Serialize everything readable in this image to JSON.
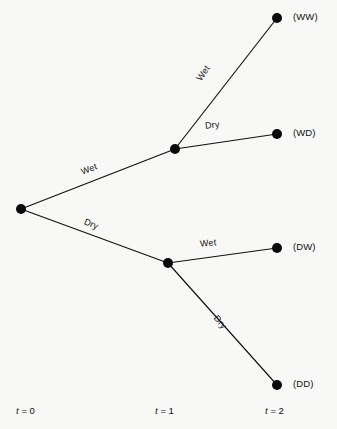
{
  "diagram": {
    "colors": {
      "background": "#f8f8f7",
      "line": "#111111",
      "node": "#0a0a0a",
      "text": "#111111"
    },
    "nodes": [
      {
        "id": "root",
        "label": "",
        "x": 21,
        "y": 209,
        "r": 5.0
      },
      {
        "id": "w",
        "label": "",
        "x": 175,
        "y": 149,
        "r": 5.0
      },
      {
        "id": "d",
        "label": "",
        "x": 168,
        "y": 263,
        "r": 5.0
      },
      {
        "id": "ww",
        "label": "(WW)",
        "x": 277,
        "y": 18,
        "r": 5.0
      },
      {
        "id": "wd",
        "label": "(WD)",
        "x": 277,
        "y": 134,
        "r": 5.0
      },
      {
        "id": "dw",
        "label": "(DW)",
        "x": 277,
        "y": 248,
        "r": 5.0
      },
      {
        "id": "dd",
        "label": "(DD)",
        "x": 277,
        "y": 385,
        "r": 5.0
      }
    ],
    "outcome_labels": [
      {
        "name": "outcome-ww",
        "text": "(WW)",
        "x": 293,
        "y": 11
      },
      {
        "name": "outcome-wd",
        "text": "(WD)",
        "x": 293,
        "y": 127
      },
      {
        "name": "outcome-dw",
        "text": "(DW)",
        "x": 293,
        "y": 241
      },
      {
        "name": "outcome-dd",
        "text": "(DD)",
        "x": 293,
        "y": 378
      }
    ],
    "edges": [
      {
        "id": "root-w",
        "from": "root",
        "to": "w",
        "label": "Wet"
      },
      {
        "id": "root-d",
        "from": "root",
        "to": "d",
        "label": "Dry"
      },
      {
        "id": "w-ww",
        "from": "w",
        "to": "ww",
        "label": "Wet"
      },
      {
        "id": "w-wd",
        "from": "w",
        "to": "wd",
        "label": "Dry"
      },
      {
        "id": "d-dw",
        "from": "d",
        "to": "dw",
        "label": "Wet"
      },
      {
        "id": "d-dd",
        "from": "d",
        "to": "dd",
        "label": "Dry"
      }
    ],
    "edge_labels": [
      {
        "name": "edge-label-root-wet",
        "text": "Wet",
        "x": 81,
        "y": 164,
        "rotate": -21
      },
      {
        "name": "edge-label-root-dry",
        "text": "Dry",
        "x": 84,
        "y": 219,
        "rotate": 22
      },
      {
        "name": "edge-label-w-wet",
        "text": "Wet",
        "x": 195,
        "y": 68,
        "rotate": -55
      },
      {
        "name": "edge-label-w-dry",
        "text": "Dry",
        "x": 205,
        "y": 120,
        "rotate": -7
      },
      {
        "name": "edge-label-d-wet",
        "text": "Wet",
        "x": 200,
        "y": 238,
        "rotate": -6
      },
      {
        "name": "edge-label-d-dry",
        "text": "Dry",
        "x": 213,
        "y": 317,
        "rotate": 51
      }
    ],
    "time_axis": [
      {
        "name": "time-label-t0",
        "var": "t",
        "eq": "=",
        "value": "0",
        "x": 16,
        "y": 405
      },
      {
        "name": "time-label-t1",
        "var": "t",
        "eq": "=",
        "value": "1",
        "x": 155,
        "y": 405
      },
      {
        "name": "time-label-t2",
        "var": "t",
        "eq": "=",
        "value": "2",
        "x": 265,
        "y": 405
      }
    ]
  }
}
